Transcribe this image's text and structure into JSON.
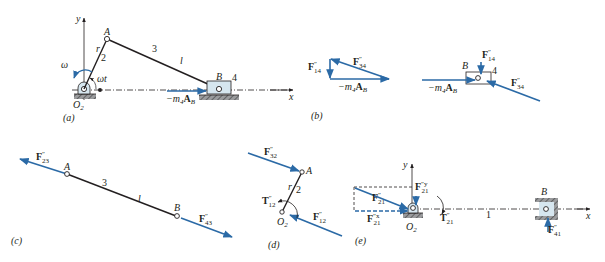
{
  "colors": {
    "force": "#2b6aa6",
    "link": "#231f20",
    "slider_fill": "#d6e6ef",
    "ground": "#6d6e71"
  },
  "panels": {
    "a": {
      "caption": "(a)",
      "axis_y": "y",
      "axis_x": "x",
      "point_A": "A",
      "point_B": "B",
      "pivot": "O",
      "pivot_sub": "2",
      "crank_length": "r",
      "crank_number": "2",
      "coupler_number": "3",
      "coupler_length": "l",
      "slider_number": "4",
      "angular_velocity": "ω",
      "angle": "ωt",
      "inertia_force": "−m",
      "inertia_force_sub": "4",
      "inertia_force_vec": "A",
      "inertia_force_vec_sub": "B"
    },
    "b": {
      "caption": "(b)",
      "polygon": {
        "F14": {
          "main": "F",
          "sup": "″",
          "sub": "14"
        },
        "F34": {
          "main": "F",
          "sup": "″",
          "sub": "34"
        },
        "inertia": {
          "main": "−m",
          "sub": "4",
          "vec": "A",
          "vec_sub": "B"
        }
      },
      "fbd": {
        "point_B": "B",
        "slider_number": "4",
        "F14": {
          "main": "F",
          "sup": "″",
          "sub": "14"
        },
        "F34": {
          "main": "F",
          "sup": "″",
          "sub": "34"
        },
        "inertia": {
          "main": "−m",
          "sub": "4",
          "vec": "A",
          "vec_sub": "B"
        }
      }
    },
    "c": {
      "caption": "(c)",
      "point_A": "A",
      "point_B": "B",
      "link_number": "3",
      "link_length": "l",
      "F23": {
        "main": "F",
        "sup": "″",
        "sub": "23"
      },
      "F43": {
        "main": "F",
        "sup": "″",
        "sub": "43"
      }
    },
    "d": {
      "caption": "(d)",
      "point_A": "A",
      "pivot": "O",
      "pivot_sub": "2",
      "crank_length": "r",
      "crank_number": "2",
      "F32": {
        "main": "F",
        "sup": "″",
        "sub": "32"
      },
      "F12": {
        "main": "F",
        "sup": "″",
        "sub": "12"
      },
      "T12": {
        "main": "T",
        "sup": "″",
        "sub": "12"
      }
    },
    "e": {
      "caption": "(e)",
      "axis_y": "y",
      "axis_x": "x",
      "pivot": "O",
      "pivot_sub": "2",
      "point_B": "B",
      "frame_number": "1",
      "F21": {
        "main": "F",
        "sup": "″",
        "sub": "21"
      },
      "F21x": {
        "main": "F",
        "sup": "″x",
        "sub": "21"
      },
      "F21y": {
        "main": "F",
        "sup": "″y",
        "sub": "21"
      },
      "T21": {
        "main": "T",
        "sup": "″",
        "sub": "21"
      },
      "F41": {
        "main": "F",
        "sup": "″",
        "sub": "41"
      }
    }
  }
}
